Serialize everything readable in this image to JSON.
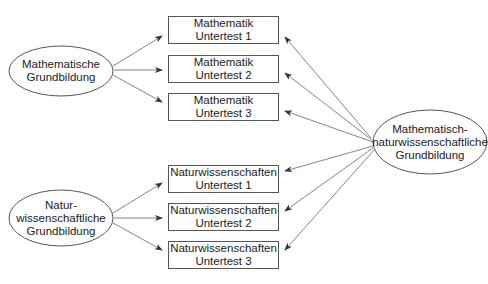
{
  "diagram": {
    "type": "structural-model",
    "factors": {
      "math": {
        "lines": [
          "Mathematische",
          "Grundbildung"
        ]
      },
      "science": {
        "lines": [
          "Natur-",
          "wissenschaftliche",
          "Grundbildung"
        ]
      },
      "general": {
        "lines": [
          "Mathematisch-",
          "naturwissenschaftliche",
          "Grundbildung"
        ]
      }
    },
    "indicators": [
      {
        "lines": [
          "Mathematik",
          "Untertest 1"
        ]
      },
      {
        "lines": [
          "Mathematik",
          "Untertest 2"
        ]
      },
      {
        "lines": [
          "Mathematik",
          "Untertest 3"
        ]
      },
      {
        "lines": [
          "Naturwissenschaften",
          "Untertest 1"
        ]
      },
      {
        "lines": [
          "Naturwissenschaften",
          "Untertest 2"
        ]
      },
      {
        "lines": [
          "Naturwissenschaften",
          "Untertest 3"
        ]
      }
    ],
    "colors": {
      "line": "#555555",
      "arrow": "#333333",
      "text": "#222222"
    }
  }
}
